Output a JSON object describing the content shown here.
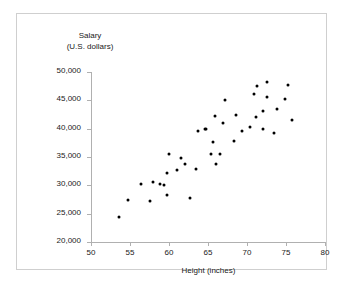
{
  "chart_data": {
    "type": "scatter",
    "title": "",
    "xlabel": "Height (inches)",
    "ylabel": "Salary",
    "ylabel_line2": "(U.S. dollars)",
    "xlim": [
      50,
      80
    ],
    "ylim": [
      20000,
      50000
    ],
    "xticks": [
      50,
      55,
      60,
      65,
      70,
      75,
      80
    ],
    "xtick_labels": [
      "50",
      "55",
      "60",
      "65",
      "70",
      "75",
      "80"
    ],
    "yticks": [
      20000,
      25000,
      30000,
      35000,
      40000,
      45000,
      50000
    ],
    "ytick_labels": [
      "20,000",
      "25,000",
      "30,000",
      "35,000",
      "40,000",
      "45,000",
      "50,000"
    ],
    "grid": false,
    "legend": false,
    "marker_color": "#000000",
    "axis_color": "#b0b0b0",
    "points": [
      {
        "x": 53.6,
        "y": 24500
      },
      {
        "x": 54.7,
        "y": 27500
      },
      {
        "x": 56.4,
        "y": 30300
      },
      {
        "x": 57.6,
        "y": 27300
      },
      {
        "x": 57.9,
        "y": 30600
      },
      {
        "x": 58.9,
        "y": 30200
      },
      {
        "x": 59.3,
        "y": 30000
      },
      {
        "x": 59.7,
        "y": 28300
      },
      {
        "x": 59.8,
        "y": 32200
      },
      {
        "x": 60.0,
        "y": 35600
      },
      {
        "x": 61.0,
        "y": 32700
      },
      {
        "x": 61.5,
        "y": 34800
      },
      {
        "x": 62.0,
        "y": 33800
      },
      {
        "x": 62.7,
        "y": 27700
      },
      {
        "x": 63.4,
        "y": 32900
      },
      {
        "x": 63.7,
        "y": 39600
      },
      {
        "x": 64.6,
        "y": 39900
      },
      {
        "x": 64.8,
        "y": 40000
      },
      {
        "x": 65.4,
        "y": 35500
      },
      {
        "x": 65.7,
        "y": 37600
      },
      {
        "x": 65.9,
        "y": 42200
      },
      {
        "x": 66.0,
        "y": 33800
      },
      {
        "x": 66.6,
        "y": 35600
      },
      {
        "x": 66.9,
        "y": 41000
      },
      {
        "x": 67.2,
        "y": 45100
      },
      {
        "x": 68.3,
        "y": 37800
      },
      {
        "x": 68.6,
        "y": 42500
      },
      {
        "x": 69.3,
        "y": 39600
      },
      {
        "x": 70.4,
        "y": 40300
      },
      {
        "x": 70.9,
        "y": 46200
      },
      {
        "x": 71.1,
        "y": 42000
      },
      {
        "x": 71.3,
        "y": 47600
      },
      {
        "x": 72.0,
        "y": 43100
      },
      {
        "x": 72.1,
        "y": 39900
      },
      {
        "x": 72.5,
        "y": 48300
      },
      {
        "x": 72.6,
        "y": 45600
      },
      {
        "x": 73.4,
        "y": 39200
      },
      {
        "x": 73.8,
        "y": 43400
      },
      {
        "x": 74.9,
        "y": 45200
      },
      {
        "x": 75.2,
        "y": 47700
      },
      {
        "x": 75.8,
        "y": 41500
      }
    ]
  }
}
